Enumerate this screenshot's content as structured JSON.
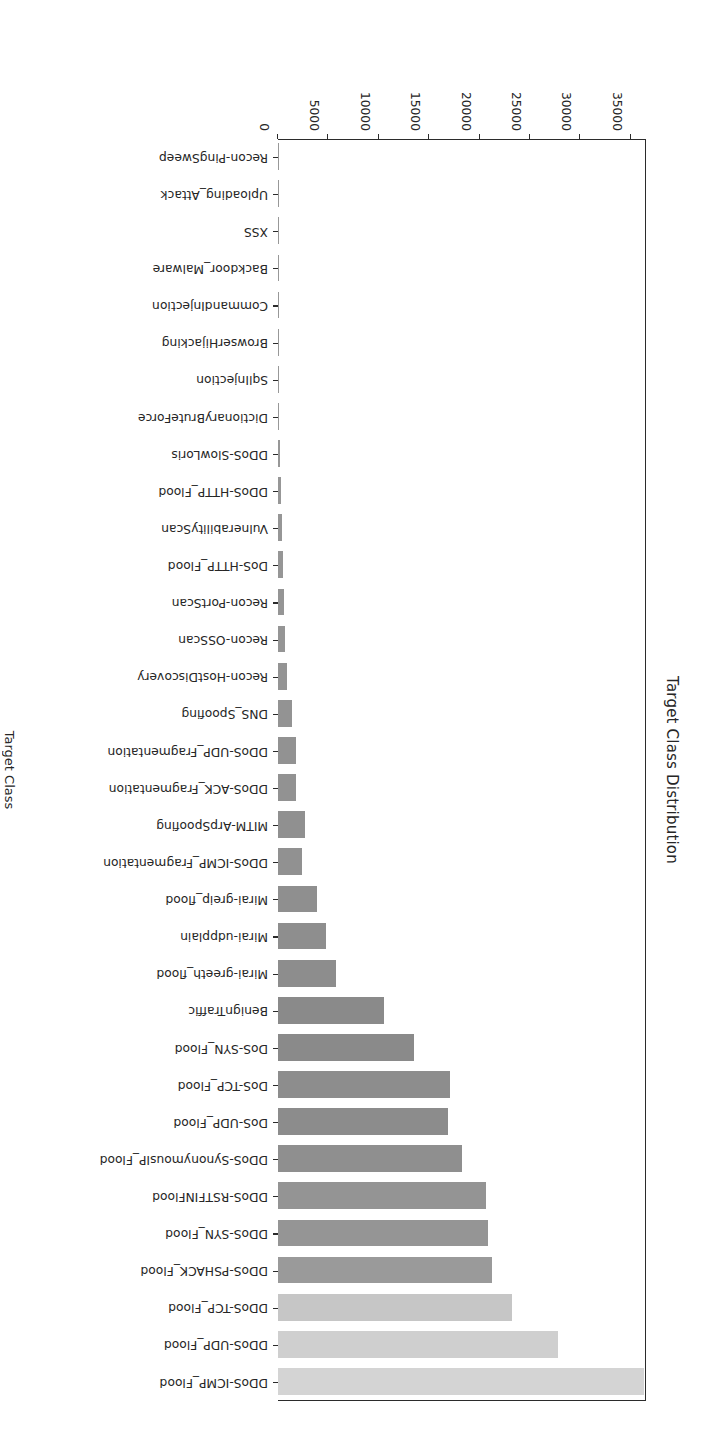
{
  "chart_data": {
    "type": "bar",
    "orientation": "horizontal",
    "title": "Target Class Distribution",
    "xlabel": "Count",
    "ylabel": "Target Class",
    "grid": false,
    "legend": null,
    "xlim": [
      0,
      36500
    ],
    "xticks": [
      0,
      5000,
      10000,
      15000,
      20000,
      25000,
      30000,
      35000
    ],
    "xtick_labels": [
      "0",
      "5000",
      "10000",
      "15000",
      "20000",
      "25000",
      "30000",
      "35000"
    ],
    "categories": [
      "DDoS-ICMP_Flood",
      "DDoS-UDP_Flood",
      "DDoS-TCP_Flood",
      "DDoS-PSHACK_Flood",
      "DDoS-SYN_Flood",
      "DDoS-RSTFINFlood",
      "DDoS-SynonymousIP_Flood",
      "DoS-UDP_Flood",
      "DoS-TCP_Flood",
      "DoS-SYN_Flood",
      "BenignTraffic",
      "Mirai-greeth_flood",
      "Mirai-udpplain",
      "Mirai-greip_flood",
      "DDoS-ICMP_Fragmentation",
      "MITM-ArpSpoofing",
      "DDoS-ACK_Fragmentation",
      "DDoS-UDP_Fragmentation",
      "DNS_Spoofing",
      "Recon-HostDiscovery",
      "Recon-OSScan",
      "Recon-PortScan",
      "DoS-HTTP_Flood",
      "VulnerabilityScan",
      "DDoS-HTTP_Flood",
      "DDoS-SlowLoris",
      "DictionaryBruteForce",
      "SqlInjection",
      "BrowserHijacking",
      "CommandInjection",
      "Backdoor_Malware",
      "XSS",
      "Uploading_Attack",
      "Recon-PingSweep"
    ],
    "values": [
      36300,
      27800,
      23250,
      21200,
      20800,
      20600,
      18250,
      16900,
      17100,
      13500,
      10550,
      5740,
      4800,
      3890,
      2350,
      2660,
      1740,
      1740,
      1430,
      920,
      720,
      600,
      500,
      410,
      280,
      210,
      130,
      60,
      55,
      50,
      45,
      35,
      15,
      10
    ],
    "bar_colors": [
      "#d4d4d4",
      "#cfcfcf",
      "#c6c6c6",
      "#9a9a9a",
      "#959595",
      "#949494",
      "#8f8f8f",
      "#8c8c8c",
      "#8d8d8d",
      "#8a8a8a",
      "#8a8a8a",
      "#8d8d8d",
      "#8e8e8e",
      "#8f8f8f",
      "#919191",
      "#909090",
      "#929292",
      "#929292",
      "#939393",
      "#949494",
      "#959595",
      "#959595",
      "#969696",
      "#969696",
      "#979797",
      "#979797",
      "#989898",
      "#989898",
      "#989898",
      "#989898",
      "#989898",
      "#989898",
      "#989898",
      "#989898"
    ]
  },
  "axes": {
    "title": "Target Class Distribution",
    "count_axis_label": "Count",
    "class_axis_label": "Target Class"
  }
}
